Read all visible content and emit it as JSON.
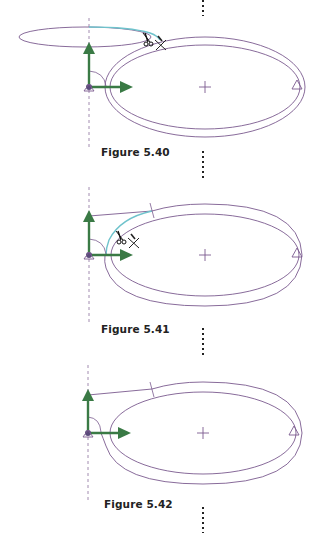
{
  "colors": {
    "sketch": "#7a5a8e",
    "axis_green": "#3a7a45",
    "highlight": "#6fc3cc",
    "dashed": "#8a6e9c",
    "dots": "#222222"
  },
  "figures": [
    {
      "id": "5.40",
      "label": "Figure 5.40",
      "state": "trim tool active on upper-left open ellipse arc",
      "icons": [
        "scissors-cursor-icon",
        "trim-x-icon"
      ]
    },
    {
      "id": "5.41",
      "label": "Figure 5.41",
      "state": "trim tool active on inner ellipse arc",
      "icons": [
        "scissors-cursor-icon",
        "trim-x-icon"
      ]
    },
    {
      "id": "5.42",
      "label": "Figure 5.42",
      "state": "trimmed profile result"
    }
  ]
}
